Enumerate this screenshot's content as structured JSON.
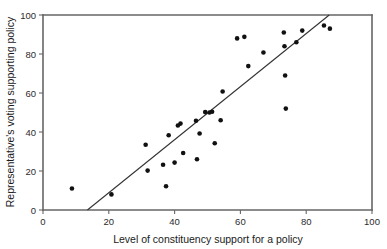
{
  "chart_data": {
    "type": "scatter",
    "title": "",
    "xlabel": "Level of constituency support for a policy",
    "ylabel": "Representative's voting supporting policy",
    "xlim": [
      0,
      100
    ],
    "ylim": [
      0,
      100
    ],
    "xticks": [
      0,
      20,
      40,
      60,
      80,
      100
    ],
    "yticks": [
      0,
      20,
      40,
      60,
      80,
      100
    ],
    "xtick_labels": [
      "0",
      "20",
      "40",
      "60",
      "80",
      "100"
    ],
    "ytick_labels": [
      "0",
      "20",
      "40",
      "60",
      "80",
      "100"
    ],
    "grid": false,
    "legend": false,
    "marker_color": "#111111",
    "axis_color": "#666666",
    "points": [
      {
        "x": 8.8,
        "y": 11.0
      },
      {
        "x": 20.8,
        "y": 8.0
      },
      {
        "x": 31.2,
        "y": 33.5
      },
      {
        "x": 31.8,
        "y": 20.2
      },
      {
        "x": 36.5,
        "y": 23.2
      },
      {
        "x": 37.4,
        "y": 12.2
      },
      {
        "x": 38.2,
        "y": 38.3
      },
      {
        "x": 40.0,
        "y": 24.3
      },
      {
        "x": 41.0,
        "y": 43.3
      },
      {
        "x": 41.8,
        "y": 44.3
      },
      {
        "x": 42.6,
        "y": 29.2
      },
      {
        "x": 46.5,
        "y": 45.8
      },
      {
        "x": 46.8,
        "y": 26.0
      },
      {
        "x": 47.6,
        "y": 39.2
      },
      {
        "x": 49.3,
        "y": 50.2
      },
      {
        "x": 50.6,
        "y": 50.0
      },
      {
        "x": 51.4,
        "y": 50.4
      },
      {
        "x": 52.2,
        "y": 34.2
      },
      {
        "x": 54.0,
        "y": 46.0
      },
      {
        "x": 54.6,
        "y": 60.8
      },
      {
        "x": 59.0,
        "y": 88.0
      },
      {
        "x": 61.2,
        "y": 88.8
      },
      {
        "x": 62.4,
        "y": 73.8
      },
      {
        "x": 67.0,
        "y": 80.8
      },
      {
        "x": 73.2,
        "y": 91.0
      },
      {
        "x": 73.4,
        "y": 84.0
      },
      {
        "x": 73.6,
        "y": 69.0
      },
      {
        "x": 73.8,
        "y": 52.0
      },
      {
        "x": 77.0,
        "y": 86.0
      },
      {
        "x": 78.8,
        "y": 92.0
      },
      {
        "x": 85.4,
        "y": 94.6
      },
      {
        "x": 87.2,
        "y": 93.0
      }
    ],
    "trend_line": {
      "x_start": 13.5,
      "y_start": 0,
      "x_end": 87.0,
      "y_end": 100
    }
  }
}
